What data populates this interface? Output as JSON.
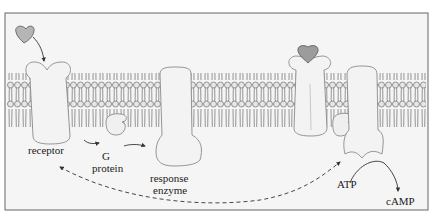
{
  "figure": {
    "colors": {
      "background": "#f4f4f4",
      "frame": "#555555",
      "protein_fill": "#f2f2f2",
      "protein_stroke": "#8a8a8a",
      "lipid": "#7a7a7a",
      "ligand_fill": "#b0b0b0",
      "arrow": "#333333"
    },
    "labels": {
      "receptor": "receptor",
      "g_protein_line1": "G",
      "g_protein_line2": "protein",
      "response_line1": "response",
      "response_line2": "enzyme",
      "atp": "ATP",
      "camp": "cAMP"
    },
    "components": [
      {
        "name": "signal molecule (free)",
        "state": "unbound"
      },
      {
        "name": "receptor",
        "state": "inactive"
      },
      {
        "name": "G protein",
        "state": "inactive"
      },
      {
        "name": "response enzyme",
        "state": "inactive"
      },
      {
        "name": "receptor with bound signal",
        "state": "active"
      },
      {
        "name": "G protein",
        "state": "bound to enzyme"
      },
      {
        "name": "response enzyme",
        "state": "active, converting ATP to cAMP"
      }
    ]
  }
}
